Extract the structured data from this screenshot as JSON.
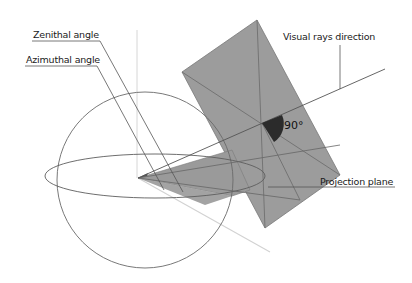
{
  "diagram": {
    "labels": {
      "zenithal": "Zenithal angle",
      "azimuthal": "Azimuthal angle",
      "visual_rays": "Visual rays direction",
      "projection_plane": "Projection plane",
      "right_angle": "90°"
    },
    "colors": {
      "plane_fill": "#9a9a9a",
      "plane_edge": "#6e6e6e",
      "line": "#555555",
      "light_line": "#cfcfcf",
      "angle_marker": "#2b2b2b",
      "background": "#ffffff"
    },
    "elements": [
      "unit-sphere",
      "equator-ellipse",
      "vertical-axis",
      "projection-plane",
      "visual-ray",
      "right-angle-marker",
      "ground-projection-line",
      "azimuth-triangle"
    ]
  }
}
